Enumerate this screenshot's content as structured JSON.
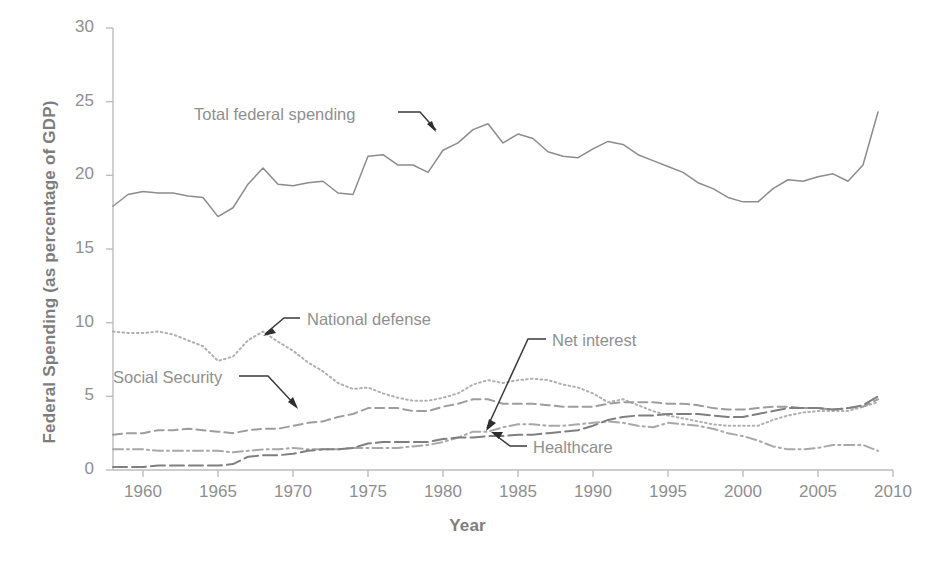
{
  "chart_data": {
    "type": "line",
    "title": "",
    "xlabel": "Year",
    "ylabel": "Federal Spending (as percentage of GDP)",
    "xlim": [
      1958,
      2010
    ],
    "ylim": [
      0,
      30
    ],
    "xticks": [
      "1960",
      "1965",
      "1970",
      "1975",
      "1980",
      "1985",
      "1990",
      "1995",
      "2000",
      "2005",
      "2010"
    ],
    "yticks": [
      "0",
      "5",
      "10",
      "15",
      "20",
      "25",
      "30"
    ],
    "grid": false,
    "legend": "inline-annotations",
    "annotations": [
      {
        "text": "Total federal spending",
        "series": "Total federal spending"
      },
      {
        "text": "National defense",
        "series": "National defense"
      },
      {
        "text": "Social Security",
        "series": "Social Security"
      },
      {
        "text": "Net interest",
        "series": "Net interest"
      },
      {
        "text": "Healthcare",
        "series": "Healthcare"
      }
    ],
    "x": [
      1958,
      1959,
      1960,
      1961,
      1962,
      1963,
      1964,
      1965,
      1966,
      1967,
      1968,
      1969,
      1970,
      1971,
      1972,
      1973,
      1974,
      1975,
      1976,
      1977,
      1978,
      1979,
      1980,
      1981,
      1982,
      1983,
      1984,
      1985,
      1986,
      1987,
      1988,
      1989,
      1990,
      1991,
      1992,
      1993,
      1994,
      1995,
      1996,
      1997,
      1998,
      1999,
      2000,
      2001,
      2002,
      2003,
      2004,
      2005,
      2006,
      2007,
      2008,
      2009
    ],
    "series": [
      {
        "name": "Total federal spending",
        "color": "#8c8c8c",
        "style": "solid",
        "values": [
          17.9,
          18.7,
          18.9,
          18.8,
          18.8,
          18.6,
          18.5,
          17.2,
          17.8,
          19.4,
          20.5,
          19.4,
          19.3,
          19.5,
          19.6,
          18.8,
          18.7,
          21.3,
          21.4,
          20.7,
          20.7,
          20.2,
          21.7,
          22.2,
          23.1,
          23.5,
          22.2,
          22.8,
          22.5,
          21.6,
          21.3,
          21.2,
          21.8,
          22.3,
          22.1,
          21.4,
          21.0,
          20.6,
          20.2,
          19.5,
          19.1,
          18.5,
          18.2,
          18.2,
          19.1,
          19.7,
          19.6,
          19.9,
          20.1,
          19.6,
          20.7,
          24.3
        ]
      },
      {
        "name": "National defense",
        "color": "#b0b0b0",
        "style": "dotted",
        "values": [
          9.4,
          9.3,
          9.3,
          9.4,
          9.2,
          8.8,
          8.4,
          7.4,
          7.7,
          8.8,
          9.4,
          8.7,
          8.1,
          7.3,
          6.7,
          5.9,
          5.5,
          5.6,
          5.2,
          4.9,
          4.7,
          4.7,
          4.9,
          5.2,
          5.8,
          6.1,
          5.9,
          6.1,
          6.2,
          6.1,
          5.8,
          5.6,
          5.2,
          4.6,
          4.8,
          4.4,
          4.0,
          3.7,
          3.5,
          3.3,
          3.1,
          3.0,
          3.0,
          3.0,
          3.4,
          3.7,
          3.9,
          4.0,
          4.0,
          4.0,
          4.3,
          4.6
        ]
      },
      {
        "name": "Social Security",
        "color": "#9d9d9d",
        "style": "dashed",
        "values": [
          2.4,
          2.5,
          2.5,
          2.7,
          2.7,
          2.8,
          2.7,
          2.6,
          2.5,
          2.7,
          2.8,
          2.8,
          3.0,
          3.2,
          3.3,
          3.6,
          3.8,
          4.2,
          4.2,
          4.2,
          4.0,
          4.0,
          4.3,
          4.5,
          4.8,
          4.8,
          4.5,
          4.5,
          4.5,
          4.4,
          4.3,
          4.3,
          4.3,
          4.5,
          4.6,
          4.6,
          4.6,
          4.5,
          4.5,
          4.4,
          4.2,
          4.1,
          4.1,
          4.2,
          4.3,
          4.3,
          4.2,
          4.2,
          4.1,
          4.2,
          4.3,
          4.8
        ]
      },
      {
        "name": "Net interest",
        "color": "#a8a8a8",
        "style": "dashdot",
        "values": [
          1.4,
          1.4,
          1.4,
          1.3,
          1.3,
          1.3,
          1.3,
          1.3,
          1.2,
          1.3,
          1.4,
          1.4,
          1.5,
          1.4,
          1.4,
          1.4,
          1.5,
          1.5,
          1.5,
          1.5,
          1.6,
          1.7,
          1.9,
          2.2,
          2.6,
          2.6,
          2.9,
          3.1,
          3.1,
          3.0,
          3.0,
          3.1,
          3.2,
          3.3,
          3.2,
          3.0,
          2.9,
          3.2,
          3.1,
          3.0,
          2.8,
          2.5,
          2.3,
          2.0,
          1.6,
          1.4,
          1.4,
          1.5,
          1.7,
          1.7,
          1.7,
          1.3
        ]
      },
      {
        "name": "Healthcare",
        "color": "#7f7f7f",
        "style": "longdash",
        "values": [
          0.2,
          0.2,
          0.2,
          0.3,
          0.3,
          0.3,
          0.3,
          0.3,
          0.4,
          0.9,
          1.0,
          1.0,
          1.1,
          1.3,
          1.4,
          1.4,
          1.5,
          1.8,
          1.9,
          1.9,
          1.9,
          1.9,
          2.1,
          2.2,
          2.2,
          2.3,
          2.3,
          2.4,
          2.4,
          2.5,
          2.6,
          2.7,
          3.0,
          3.4,
          3.6,
          3.7,
          3.7,
          3.8,
          3.8,
          3.8,
          3.7,
          3.6,
          3.6,
          3.8,
          4.0,
          4.2,
          4.2,
          4.2,
          4.1,
          4.2,
          4.4,
          5.0
        ]
      }
    ]
  },
  "axis": {
    "y_title": "Federal Spending (as percentage of GDP)",
    "x_title": "Year",
    "y_ticks": [
      "30",
      "25",
      "20",
      "15",
      "10",
      "5",
      "0"
    ],
    "x_ticks": [
      "1960",
      "1965",
      "1970",
      "1975",
      "1980",
      "1985",
      "1990",
      "1995",
      "2000",
      "2005",
      "2010"
    ]
  },
  "annotations": {
    "total": "Total federal spending",
    "defense": "National defense",
    "social": "Social Security",
    "interest": "Net interest",
    "health": "Healthcare"
  }
}
